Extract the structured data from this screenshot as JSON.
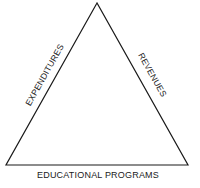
{
  "diagram": {
    "shape": "triangle",
    "line_color": "#1a1a1a",
    "background": "#ffffff",
    "vertices": {
      "top": [
        97,
        3
      ],
      "bottom_left": [
        6,
        165
      ],
      "bottom_right": [
        188,
        165
      ]
    },
    "sides": {
      "left": {
        "label": "EXPENDITURES"
      },
      "right": {
        "label": "REVENUES"
      },
      "bottom": {
        "label": "EDUCATIONAL PROGRAMS"
      }
    }
  }
}
